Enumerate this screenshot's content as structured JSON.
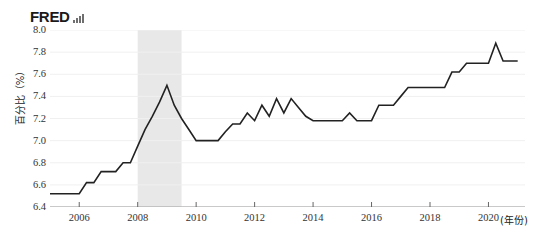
{
  "branding": {
    "wordmark": "FRED",
    "logo_icon": "bar-chart-icon"
  },
  "chart_data": {
    "type": "line",
    "title": "",
    "subtitle": "",
    "xlabel": "(年份)",
    "ylabel": "百分比（%）",
    "xlim": [
      2005.0,
      2021.25
    ],
    "ylim": [
      6.4,
      8.0
    ],
    "grid": true,
    "legend": "none",
    "line_color": "#222222",
    "recession_band_color": "#e8e8e8",
    "y_ticks": [
      "8.0",
      "7.8",
      "7.6",
      "7.4",
      "7.2",
      "7.0",
      "6.8",
      "6.6",
      "6.4"
    ],
    "y_tick_values": [
      8.0,
      7.8,
      7.6,
      7.4,
      7.2,
      7.0,
      6.8,
      6.6,
      6.4
    ],
    "x_ticks": [
      "2006",
      "2008",
      "2010",
      "2012",
      "2014",
      "2016",
      "2018",
      "2020"
    ],
    "x_tick_values": [
      2006,
      2008,
      2010,
      2012,
      2014,
      2016,
      2018,
      2020
    ],
    "recession_bands": [
      {
        "start": 2008.0,
        "end": 2009.5
      }
    ],
    "series": [
      {
        "name": "百分比",
        "x": [
          2005.0,
          2005.25,
          2005.5,
          2005.75,
          2006.0,
          2006.25,
          2006.5,
          2006.75,
          2007.0,
          2007.25,
          2007.5,
          2007.75,
          2008.0,
          2008.25,
          2008.5,
          2008.75,
          2009.0,
          2009.25,
          2009.5,
          2009.75,
          2010.0,
          2010.25,
          2010.5,
          2010.75,
          2011.0,
          2011.25,
          2011.5,
          2011.75,
          2012.0,
          2012.25,
          2012.5,
          2012.75,
          2013.0,
          2013.25,
          2013.5,
          2013.75,
          2014.0,
          2014.25,
          2014.5,
          2014.75,
          2015.0,
          2015.25,
          2015.5,
          2015.75,
          2016.0,
          2016.25,
          2016.5,
          2016.75,
          2017.0,
          2017.25,
          2017.5,
          2017.75,
          2018.0,
          2018.25,
          2018.5,
          2018.75,
          2019.0,
          2019.25,
          2019.5,
          2019.75,
          2020.0,
          2020.25,
          2020.5,
          2020.75,
          2021.0
        ],
        "y": [
          6.52,
          6.52,
          6.52,
          6.52,
          6.52,
          6.62,
          6.62,
          6.72,
          6.72,
          6.72,
          6.8,
          6.8,
          6.95,
          7.1,
          7.22,
          7.35,
          7.5,
          7.32,
          7.2,
          7.1,
          7.0,
          7.0,
          7.0,
          7.0,
          7.08,
          7.15,
          7.15,
          7.25,
          7.18,
          7.32,
          7.22,
          7.38,
          7.25,
          7.38,
          7.3,
          7.22,
          7.18,
          7.18,
          7.18,
          7.18,
          7.18,
          7.25,
          7.18,
          7.18,
          7.18,
          7.32,
          7.32,
          7.32,
          7.4,
          7.48,
          7.48,
          7.48,
          7.48,
          7.48,
          7.48,
          7.62,
          7.62,
          7.7,
          7.7,
          7.7,
          7.7,
          7.88,
          7.72,
          7.72,
          7.72
        ]
      }
    ]
  }
}
